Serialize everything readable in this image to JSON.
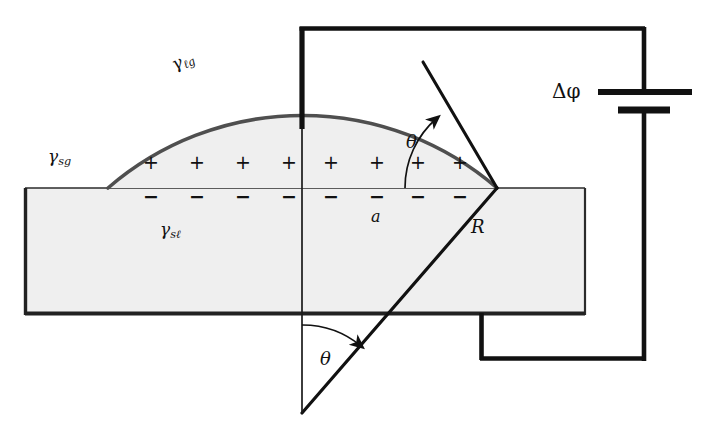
{
  "figure": {
    "background": "#ffffff",
    "width": 710,
    "height": 433
  },
  "colors": {
    "ink": "#111111",
    "wire": "#111111",
    "substrate_fill": "#efefef",
    "substrate_stroke": "#2b2b2b",
    "droplet_fill": "#efefef",
    "droplet_stroke": "#4a4a4a",
    "thin_line": "#1a1a1a"
  },
  "labels": {
    "gamma_lg": {
      "base": "γ",
      "sub": "ℓg",
      "text": "γℓg",
      "x": 168,
      "y": 66,
      "rotation": -28,
      "font_size": 17
    },
    "gamma_sg": {
      "base": "γ",
      "sub": "sg",
      "text": "γsg",
      "x": 52,
      "y": 143,
      "rotation": 0,
      "font_size": 17
    },
    "gamma_sl": {
      "base": "γ",
      "sub": "sℓ",
      "text": "γsℓ",
      "x": 163,
      "y": 218,
      "rotation": 0,
      "font_size": 17
    },
    "a": {
      "text": "a",
      "x": 374,
      "y": 213,
      "font_size": 16
    },
    "R": {
      "text": "R",
      "x": 475,
      "y": 220,
      "font_size": 17
    },
    "theta_upper": {
      "text": "θ",
      "x": 410,
      "y": 131,
      "font_size": 17
    },
    "theta_lower": {
      "text": "θ",
      "x": 323,
      "y": 351,
      "font_size": 17
    },
    "delta_phi": {
      "text": "Δφ",
      "x": 556,
      "y": 85,
      "font_size": 19
    }
  },
  "charges": {
    "positive_symbol": "+",
    "negative_symbol": "−",
    "positive_count": 8,
    "negative_count": 8,
    "positive_y": 163,
    "negative_y": 197,
    "positive_x": [
      150,
      196,
      242,
      288,
      330,
      376,
      417,
      459
    ],
    "negative_x": [
      150,
      196,
      242,
      288,
      330,
      376,
      417,
      459
    ],
    "positive_font_size": 19,
    "negative_font_size": 19
  },
  "geometry": {
    "substrate": {
      "x": 25,
      "y": 188,
      "width": 560,
      "height": 127
    },
    "droplet": {
      "left_contact_x": 108,
      "right_contact_x": 497,
      "baseline_y": 188,
      "apex_y": 88,
      "center_x": 302,
      "center_y": 413,
      "radius": 297
    },
    "electrode": {
      "x": 302,
      "top_y": 27,
      "thick_bottom_y": 128,
      "thin_bottom_y": 413
    },
    "circuit": {
      "top_wire_y": 27,
      "top_wire_x1": 302,
      "top_wire_x2": 645,
      "right_wire_x": 645,
      "bottom_wire_y": 360,
      "bottom_wire_x1": 480,
      "bottom_wire_x2": 645,
      "ground_riser_x": 480,
      "ground_riser_top_y": 315
    },
    "battery": {
      "x": 645,
      "long_plate_y": 92,
      "long_plate_half_width": 47,
      "short_plate_y": 110,
      "short_plate_half_width": 26
    },
    "radius_line": {
      "x1": 302,
      "y1": 413,
      "x2": 497,
      "y2": 188
    },
    "tangent_line": {
      "x1": 497,
      "y1": 188,
      "x2": 423,
      "y2": 62
    },
    "theta_upper_arc": {
      "cx": 497,
      "cy": 188,
      "radius": 92
    },
    "theta_lower_arc": {
      "cx": 302,
      "cy": 413,
      "radius": 92
    }
  },
  "legend": {
    "gamma_lg_meaning": "liquid-gas interfacial tension",
    "gamma_sg_meaning": "solid-gas interfacial tension",
    "gamma_sl_meaning": "solid-liquid interfacial tension",
    "theta_meaning": "contact angle",
    "R_meaning": "droplet cap radius",
    "a_meaning": "contact radius",
    "delta_phi_meaning": "applied potential difference"
  }
}
